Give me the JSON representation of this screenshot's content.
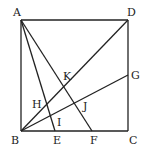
{
  "diagram": {
    "type": "geometry",
    "points": {
      "A": {
        "x": 21,
        "y": 20,
        "label": "A",
        "lx": 13,
        "ly": 16
      },
      "B": {
        "x": 21,
        "y": 131,
        "label": "B",
        "lx": 11,
        "ly": 144
      },
      "C": {
        "x": 128,
        "y": 131,
        "label": "C",
        "lx": 129,
        "ly": 144
      },
      "D": {
        "x": 128,
        "y": 20,
        "label": "D",
        "lx": 127,
        "ly": 16
      },
      "E": {
        "x": 55,
        "y": 131,
        "label": "E",
        "lx": 53,
        "ly": 144
      },
      "F": {
        "x": 92,
        "y": 131,
        "label": "F",
        "lx": 90,
        "ly": 144
      },
      "G": {
        "x": 128,
        "y": 75,
        "label": "G",
        "lx": 131,
        "ly": 79
      },
      "H": {
        "label": "H",
        "lx": 32,
        "ly": 108
      },
      "I": {
        "label": "I",
        "lx": 57,
        "ly": 126
      },
      "J": {
        "label": "J",
        "lx": 83,
        "ly": 110
      },
      "K": {
        "label": "K",
        "lx": 63,
        "ly": 80
      }
    },
    "segments": [
      [
        "A",
        "B"
      ],
      [
        "B",
        "C"
      ],
      [
        "C",
        "D"
      ],
      [
        "D",
        "A"
      ],
      [
        "A",
        "E"
      ],
      [
        "A",
        "F"
      ],
      [
        "B",
        "D"
      ],
      [
        "B",
        "G"
      ]
    ],
    "labels": {
      "A": "A",
      "B": "B",
      "C": "C",
      "D": "D",
      "E": "E",
      "F": "F",
      "G": "G",
      "H": "H",
      "I": "I",
      "J": "J",
      "K": "K"
    }
  }
}
